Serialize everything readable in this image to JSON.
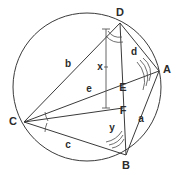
{
  "figure": {
    "type": "circle-geometry-diagram",
    "width": 176,
    "height": 175,
    "background_color": "#ffffff",
    "stroke_color": "#3a3a3a",
    "label_color": "#2b2b2b"
  },
  "circle": {
    "name": "circumscribed-circle",
    "center_x": 87,
    "center_y": 87,
    "radius": 74
  },
  "vertices": [
    {
      "id": "D",
      "label": "D",
      "x": 120,
      "y": 23,
      "label_x": 120,
      "label_y": 13
    },
    {
      "id": "A",
      "label": "A",
      "x": 159,
      "y": 71,
      "label_x": 167,
      "label_y": 70
    },
    {
      "id": "C",
      "label": "C",
      "x": 24,
      "y": 122,
      "label_x": 13,
      "label_y": 122
    },
    {
      "id": "B",
      "label": "B",
      "x": 126,
      "y": 155,
      "label_x": 126,
      "label_y": 166
    },
    {
      "id": "E",
      "label": "E",
      "x": 122,
      "y": 88,
      "label_x": 123,
      "label_y": 88
    },
    {
      "id": "F",
      "label": "F",
      "x": 122,
      "y": 108,
      "label_x": 123,
      "label_y": 111
    }
  ],
  "segment_labels": [
    {
      "id": "b",
      "label": "b",
      "x": 68,
      "y": 64
    },
    {
      "id": "x",
      "label": "x",
      "x": 100,
      "y": 67
    },
    {
      "id": "d",
      "label": "d",
      "x": 134,
      "y": 52
    },
    {
      "id": "e",
      "label": "e",
      "x": 89,
      "y": 89
    },
    {
      "id": "a",
      "label": "a",
      "x": 141,
      "y": 119
    },
    {
      "id": "y",
      "label": "y",
      "x": 112,
      "y": 128
    },
    {
      "id": "c",
      "label": "c",
      "x": 68,
      "y": 145
    }
  ],
  "chords": [
    {
      "id": "D-B",
      "from": "D",
      "to": "B"
    },
    {
      "id": "D-A",
      "from": "D",
      "to": "A"
    },
    {
      "id": "D-C",
      "from": "D",
      "to": "C"
    },
    {
      "id": "A-B",
      "from": "A",
      "to": "B"
    },
    {
      "id": "C-B",
      "from": "C",
      "to": "B"
    },
    {
      "id": "C-A",
      "from": "C",
      "to": "A"
    },
    {
      "id": "C-F",
      "from": "C",
      "to": "F"
    }
  ],
  "angle_marks": [
    {
      "id": "angle-at-C-upper",
      "vertex": "C",
      "arcs": 1
    },
    {
      "id": "angle-at-C-lower",
      "vertex": "C",
      "arcs": 1
    },
    {
      "id": "angle-at-A",
      "vertex": "A",
      "arcs": 3
    },
    {
      "id": "angle-at-B",
      "vertex": "B",
      "arcs": 3
    },
    {
      "id": "angle-at-D",
      "vertex": "D",
      "arcs": 2
    }
  ],
  "dimension_bracket": {
    "id": "x-dimension",
    "label": "x",
    "from_x": 106,
    "from_y": 27,
    "to_x": 106,
    "to_y": 108
  }
}
